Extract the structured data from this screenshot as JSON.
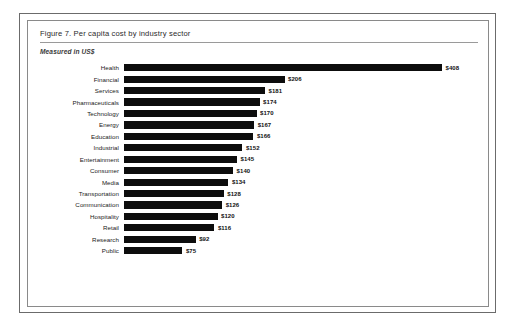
{
  "figure": {
    "title": "Figure 7. Per capita cost by industry sector",
    "subtitle": "Measured in US$"
  },
  "chart_data": {
    "type": "bar",
    "orientation": "horizontal",
    "title": "Figure 7. Per capita cost by industry sector",
    "subtitle": "Measured in US$",
    "xlabel": "",
    "ylabel": "",
    "currency": "US$",
    "grid": false,
    "legend": false,
    "axis_visible": false,
    "xlim": [
      0,
      408
    ],
    "categories": [
      "Health",
      "Financial",
      "Services",
      "Pharmaceuticals",
      "Technology",
      "Energy",
      "Education",
      "Industrial",
      "Entertainment",
      "Consumer",
      "Media",
      "Transportation",
      "Communication",
      "Hospitality",
      "Retail",
      "Research",
      "Public"
    ],
    "values": [
      408,
      206,
      181,
      174,
      170,
      167,
      166,
      152,
      145,
      140,
      134,
      128,
      126,
      120,
      116,
      92,
      75
    ],
    "value_labels": [
      "$408",
      "$206",
      "$181",
      "$174",
      "$170",
      "$167",
      "$166",
      "$152",
      "$145",
      "$140",
      "$134",
      "$128",
      "$126",
      "$120",
      "$116",
      "$92",
      "$75"
    ],
    "bar_color": "#0d0d0d"
  }
}
